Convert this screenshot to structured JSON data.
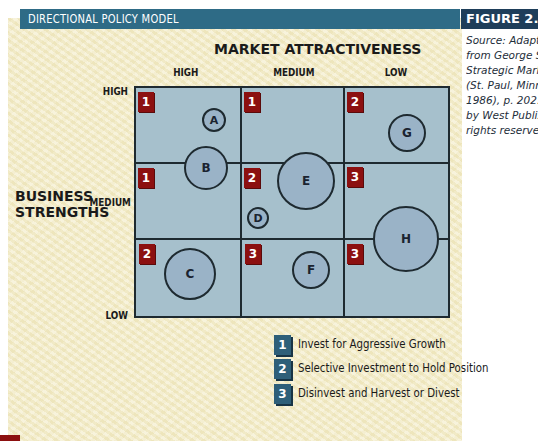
{
  "header": {
    "title": "DIRECTIONAL POLICY MODEL",
    "figure_label": "FIGURE 2.6",
    "source_lines": [
      "Source: Adapted",
      "from George S.",
      "Strategic Mark",
      "(St. Paul, Minn.:",
      "1986), p. 202. C",
      "by West Publish",
      "rights reserved."
    ]
  },
  "axes": {
    "x_title": "MARKET ATTRACTIVENESS",
    "x_ticks": [
      "HIGH",
      "MEDIUM",
      "LOW"
    ],
    "y_title_line1": "BUSINESS",
    "y_title_line2": "STRENGTHS",
    "y_ticks": [
      "HIGH",
      "MEDIUM",
      "LOW"
    ]
  },
  "cells": [
    {
      "row": "HIGH",
      "col": "HIGH",
      "badge": "1"
    },
    {
      "row": "HIGH",
      "col": "MEDIUM",
      "badge": "1"
    },
    {
      "row": "HIGH",
      "col": "LOW",
      "badge": "2"
    },
    {
      "row": "MEDIUM",
      "col": "HIGH",
      "badge": "1"
    },
    {
      "row": "MEDIUM",
      "col": "MEDIUM",
      "badge": "2"
    },
    {
      "row": "MEDIUM",
      "col": "LOW",
      "badge": "3"
    },
    {
      "row": "LOW",
      "col": "HIGH",
      "badge": "2"
    },
    {
      "row": "LOW",
      "col": "MEDIUM",
      "badge": "3"
    },
    {
      "row": "LOW",
      "col": "LOW",
      "badge": "3"
    }
  ],
  "bubbles": [
    {
      "label": "A",
      "cx": 214,
      "cy": 120,
      "r": 12
    },
    {
      "label": "B",
      "cx": 206,
      "cy": 168,
      "r": 22
    },
    {
      "label": "C",
      "cx": 190,
      "cy": 274,
      "r": 26
    },
    {
      "label": "D",
      "cx": 258,
      "cy": 218,
      "r": 11
    },
    {
      "label": "E",
      "cx": 306,
      "cy": 181,
      "r": 29
    },
    {
      "label": "F",
      "cx": 311,
      "cy": 270,
      "r": 19
    },
    {
      "label": "G",
      "cx": 407,
      "cy": 133,
      "r": 19
    },
    {
      "label": "H",
      "cx": 406,
      "cy": 239,
      "r": 33
    }
  ],
  "legend": [
    {
      "num": "1",
      "text": "Invest for Aggressive Growth"
    },
    {
      "num": "2",
      "text": "Selective Investment to Hold Position"
    },
    {
      "num": "3",
      "text": "Disinvest and Harvest or Divest"
    }
  ],
  "colors": {
    "header_bar": "#2e6b86",
    "figure_box": "#1e3e5a",
    "grid_fill": "#a6c0cc",
    "bubble_fill": "#9ab3c7",
    "badge_red": "#8c1010",
    "legend_blue": "#2e5f79",
    "panel_bg": "#f3ecc8"
  }
}
